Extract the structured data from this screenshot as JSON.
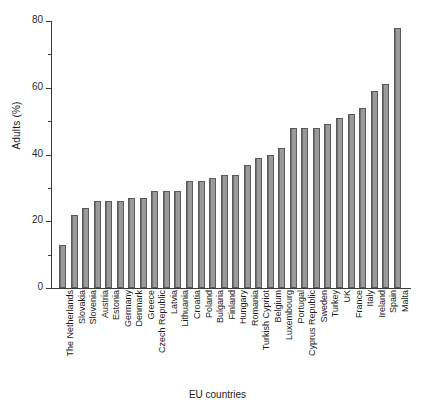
{
  "chart_data": {
    "type": "bar",
    "title": "",
    "xlabel": "EU countries",
    "ylabel": "Adults (%)",
    "ylim": [
      0,
      80
    ],
    "yticks": [
      0,
      20,
      40,
      60,
      80
    ],
    "yminorticks": [
      10,
      30,
      50,
      70
    ],
    "grid": false,
    "legend": null,
    "bar_color": "#8c8c8c",
    "bar_edge_color": "#5a5a5a",
    "categories": [
      "The Netherlands",
      "Slovakia",
      "Slovenia",
      "Austria",
      "Estonia",
      "Germany",
      "Denmark",
      "Greece",
      "Czech Republic",
      "Latvia",
      "Lithuania",
      "Croatia",
      "Poland",
      "Bulgaria",
      "Finland",
      "Hungary",
      "Romania",
      "Turkish Cypriot",
      "Belgium",
      "Luxembourg",
      "Portugal",
      "Cyprus Republic",
      "Sweden",
      "Turkey",
      "UK",
      "France",
      "Italy",
      "Ireland",
      "Spain",
      "Malta"
    ],
    "values": [
      13,
      22,
      24,
      26,
      26,
      26,
      27,
      27,
      29,
      29,
      29,
      32,
      32,
      33,
      34,
      34,
      37,
      39,
      40,
      42,
      48,
      48,
      48,
      49,
      51,
      52,
      54,
      59,
      61,
      78
    ]
  }
}
